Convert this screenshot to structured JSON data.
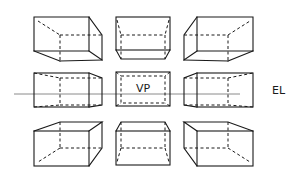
{
  "diagram": {
    "type": "one-point perspective of rectangular boxes",
    "labels": {
      "vanishing_point": "VP",
      "eye_level": "EL"
    },
    "colors": {
      "line": "#1a1a1a",
      "horizon_line": "#8a8a8a",
      "background": "#ffffff"
    },
    "grid": {
      "rows": [
        "above-eye-level",
        "at-eye-level",
        "below-eye-level"
      ],
      "columns": [
        "left-of-vp",
        "center",
        "right-of-vp"
      ],
      "box_count": 9
    }
  }
}
